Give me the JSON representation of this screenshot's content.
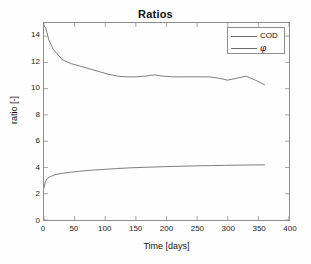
{
  "chart_data": {
    "type": "line",
    "title": "Ratios",
    "xlabel": "Time [days]",
    "ylabel": "ratio [-]",
    "xlim": [
      0,
      400
    ],
    "ylim": [
      0,
      15
    ],
    "xticks": [
      0,
      50,
      100,
      150,
      200,
      250,
      300,
      350,
      400
    ],
    "yticks": [
      0,
      2,
      4,
      6,
      8,
      10,
      12,
      14
    ],
    "grid": false,
    "legend_position": "top-right",
    "line_color": "#6e6e6e",
    "axis_color": "#8d8d8d",
    "series": [
      {
        "name": "COD",
        "legend_label": "COD",
        "x": [
          0,
          3,
          8,
          15,
          30,
          45,
          60,
          75,
          90,
          105,
          120,
          135,
          150,
          165,
          180,
          195,
          210,
          225,
          240,
          255,
          270,
          285,
          300,
          315,
          330,
          345,
          360
        ],
        "values": [
          14.8,
          14.6,
          13.7,
          13.0,
          12.2,
          11.9,
          11.7,
          11.5,
          11.3,
          11.1,
          10.95,
          10.9,
          10.9,
          10.95,
          11.05,
          10.95,
          10.9,
          10.9,
          10.9,
          10.9,
          10.9,
          10.8,
          10.65,
          10.8,
          10.95,
          10.65,
          10.3
        ]
      },
      {
        "name": "phi",
        "legend_label": "φ",
        "x": [
          0,
          2,
          5,
          10,
          18,
          30,
          45,
          60,
          80,
          100,
          120,
          145,
          170,
          195,
          220,
          245,
          270,
          295,
          320,
          340,
          360
        ],
        "values": [
          2.45,
          2.9,
          3.15,
          3.3,
          3.45,
          3.55,
          3.65,
          3.72,
          3.8,
          3.86,
          3.92,
          3.98,
          4.02,
          4.06,
          4.09,
          4.12,
          4.14,
          4.16,
          4.18,
          4.19,
          4.2
        ]
      }
    ]
  }
}
